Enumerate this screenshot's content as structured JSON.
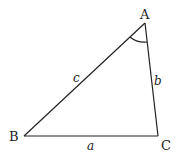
{
  "diagram": {
    "type": "triangle",
    "vertices": [
      {
        "id": "A",
        "label": "A",
        "x": 145,
        "y": 23,
        "label_x": 140,
        "label_y": 19
      },
      {
        "id": "B",
        "label": "B",
        "x": 24,
        "y": 136,
        "label_x": 9,
        "label_y": 141
      },
      {
        "id": "C",
        "label": "C",
        "x": 158,
        "y": 136,
        "label_x": 161,
        "label_y": 150
      }
    ],
    "sides": [
      {
        "id": "c",
        "label": "c",
        "from": "B",
        "to": "A",
        "label_x": 73,
        "label_y": 82
      },
      {
        "id": "b",
        "label": "b",
        "from": "A",
        "to": "C",
        "label_x": 154,
        "label_y": 85
      },
      {
        "id": "a",
        "label": "a",
        "from": "B",
        "to": "C",
        "label_x": 87,
        "label_y": 150
      }
    ],
    "angle_marker": {
      "at": "A",
      "type": "arc"
    }
  }
}
